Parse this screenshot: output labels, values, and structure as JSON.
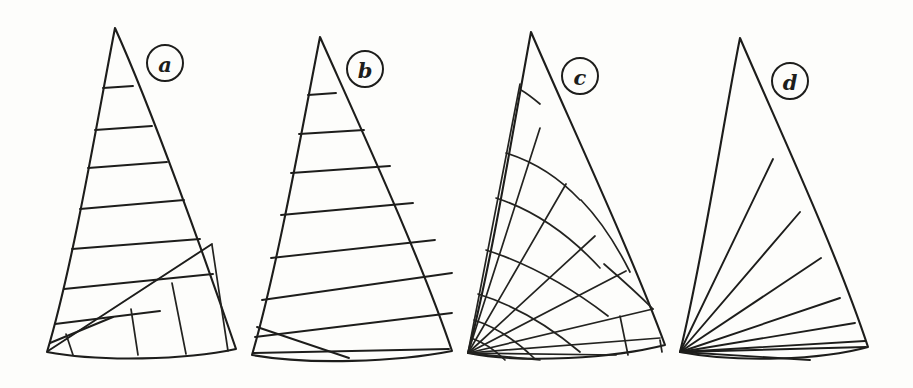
{
  "figure": {
    "background_color": "#fdfdfb",
    "ink_color": "#1d1d1b",
    "width": 913,
    "height": 388,
    "panel_count": 4
  },
  "panels": [
    {
      "id": "panel-a",
      "label": "a",
      "name": "cross-cut-with-mitre",
      "description": "Triangular sail with horizontal cross-cut seams above a diagonal mitre line and vertical panels below",
      "label_position": {
        "cx": 165,
        "cy": 63,
        "r": 18
      },
      "outline": {
        "head": [
          115,
          28
        ],
        "tack": [
          47,
          352
        ],
        "clew": [
          236,
          349
        ],
        "luff_control": [
          76,
          190
        ],
        "leech_control": [
          182,
          185
        ],
        "foot_control": [
          140,
          358
        ]
      },
      "seam_count": 13
    },
    {
      "id": "panel-b",
      "label": "b",
      "name": "cross-cut",
      "description": "Triangular sail with parallel horizontal cross-cut seams running from luff to leech",
      "label_position": {
        "cx": 365,
        "cy": 69,
        "r": 18
      },
      "outline": {
        "head": [
          320,
          37
        ],
        "tack": [
          252,
          355
        ],
        "clew": [
          452,
          351
        ],
        "luff_control": [
          280,
          196
        ],
        "leech_control": [
          392,
          195
        ],
        "foot_control": [
          350,
          361
        ]
      },
      "seam_count": 8
    },
    {
      "id": "panel-c",
      "label": "c",
      "name": "radial-grid-cut",
      "description": "Triangular sail with radial seams from the tack crossed by concentric arc seams forming a grid",
      "label_position": {
        "cx": 580,
        "cy": 76,
        "r": 18
      },
      "outline": {
        "head": [
          531,
          32
        ],
        "tack": [
          468,
          353
        ],
        "clew": [
          665,
          345
        ],
        "luff_control": [
          492,
          192
        ],
        "leech_control": [
          604,
          190
        ],
        "foot_control": [
          566,
          358
        ]
      },
      "radial_count": 9,
      "arc_count": 8
    },
    {
      "id": "panel-d",
      "label": "d",
      "name": "radial-mitre-cut",
      "description": "Triangular sail with radial seams all converging at the tack corner",
      "label_position": {
        "cx": 790,
        "cy": 81,
        "r": 18
      },
      "outline": {
        "head": [
          740,
          38
        ],
        "tack": [
          680,
          352
        ],
        "clew": [
          868,
          347
        ],
        "luff_control": [
          702,
          196
        ],
        "leech_control": [
          812,
          192
        ],
        "foot_control": [
          772,
          356
        ]
      },
      "radial_count": 8
    }
  ],
  "icons": {
    "label_badge": "circled-letter"
  }
}
